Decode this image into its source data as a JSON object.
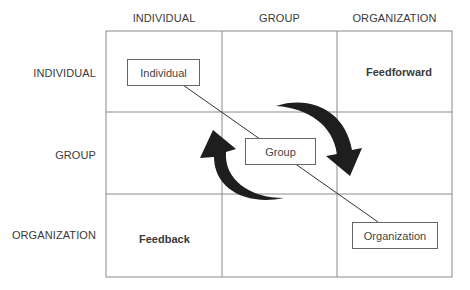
{
  "columns": [
    "INDIVIDUAL",
    "GROUP",
    "ORGANIZATION"
  ],
  "rows": [
    "INDIVIDUAL",
    "GROUP",
    "ORGANIZATION"
  ],
  "boxes": {
    "individual": "Individual",
    "group": "Group",
    "organization": "Organization"
  },
  "cell_labels": {
    "feedforward": "Feedforward",
    "feedback": "Feedback"
  },
  "colors": {
    "grid": "#8a8a8a",
    "arrow": "#1e1e1e",
    "line": "#333333"
  }
}
